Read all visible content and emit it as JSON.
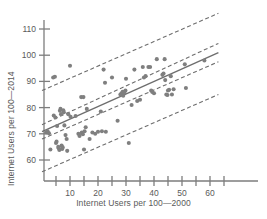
{
  "chart_data": {
    "type": "scatter",
    "title": "",
    "xlabel": "Internet Users per 100—2000",
    "ylabel": "Internet Users per 100—2014",
    "xlim": [
      0,
      66
    ],
    "ylim": [
      55,
      116
    ],
    "xticks": [
      10,
      20,
      30,
      40,
      50,
      60
    ],
    "xminorticks": [
      5,
      15,
      25,
      35,
      45,
      55,
      65
    ],
    "yticks": [
      60,
      70,
      80,
      90,
      100,
      110
    ],
    "grid": false,
    "legend": null,
    "marker_color": "#808080",
    "line_color": "#6e6e6e",
    "points": [
      [
        1.5,
        70.5
      ],
      [
        2.0,
        71.0
      ],
      [
        2.5,
        70.2
      ],
      [
        3.0,
        64.0
      ],
      [
        4.0,
        91.5
      ],
      [
        4.6,
        91.8
      ],
      [
        4.2,
        77.0
      ],
      [
        4.8,
        76.2
      ],
      [
        5.0,
        66.5
      ],
      [
        5.2,
        67.0
      ],
      [
        5.4,
        73.0
      ],
      [
        5.8,
        65.0
      ],
      [
        6.0,
        64.5
      ],
      [
        6.2,
        63.8
      ],
      [
        6.4,
        78.8
      ],
      [
        6.6,
        79.5
      ],
      [
        6.8,
        77.5
      ],
      [
        7.0,
        65.5
      ],
      [
        7.2,
        64.2
      ],
      [
        7.4,
        64.8
      ],
      [
        7.6,
        79.0
      ],
      [
        7.8,
        78.2
      ],
      [
        8.0,
        73.2
      ],
      [
        8.4,
        69.5
      ],
      [
        8.8,
        68.0
      ],
      [
        9.0,
        63.5
      ],
      [
        9.4,
        77.5
      ],
      [
        10.0,
        96.0
      ],
      [
        10.2,
        76.5
      ],
      [
        12.0,
        76.8
      ],
      [
        13.0,
        70.0
      ],
      [
        13.4,
        69.2
      ],
      [
        14.0,
        84.0
      ],
      [
        14.8,
        84.0
      ],
      [
        14.2,
        70.5
      ],
      [
        14.6,
        69.8
      ],
      [
        15.0,
        64.0
      ],
      [
        15.2,
        71.0
      ],
      [
        15.6,
        72.5
      ],
      [
        16.0,
        79.5
      ],
      [
        17.0,
        68.0
      ],
      [
        18.0,
        70.5
      ],
      [
        19.0,
        70.0
      ],
      [
        20.0,
        70.8
      ],
      [
        21.0,
        78.5
      ],
      [
        21.4,
        71.0
      ],
      [
        22.0,
        94.5
      ],
      [
        22.5,
        89.5
      ],
      [
        22.8,
        70.8
      ],
      [
        25.0,
        91.5
      ],
      [
        27.0,
        75.0
      ],
      [
        28.0,
        85.0
      ],
      [
        28.4,
        85.5
      ],
      [
        28.8,
        86.0
      ],
      [
        29.0,
        84.5
      ],
      [
        29.4,
        85.8
      ],
      [
        29.8,
        86.5
      ],
      [
        30.0,
        91.0
      ],
      [
        31.0,
        66.5
      ],
      [
        32.0,
        81.0
      ],
      [
        33.0,
        94.5
      ],
      [
        34.0,
        82.5
      ],
      [
        35.0,
        83.0
      ],
      [
        36.0,
        95.5
      ],
      [
        36.4,
        91.5
      ],
      [
        37.0,
        92.0
      ],
      [
        38.0,
        95.5
      ],
      [
        38.6,
        95.5
      ],
      [
        39.0,
        86.5
      ],
      [
        39.4,
        86.0
      ],
      [
        40.0,
        85.5
      ],
      [
        41.0,
        98.5
      ],
      [
        43.0,
        92.5
      ],
      [
        43.4,
        93.0
      ],
      [
        43.8,
        98.5
      ],
      [
        44.0,
        90.5
      ],
      [
        44.4,
        85.0
      ],
      [
        44.8,
        84.8
      ],
      [
        45.0,
        86.5
      ],
      [
        45.4,
        86.8
      ],
      [
        46.0,
        92.0
      ],
      [
        46.4,
        85.0
      ],
      [
        47.0,
        87.0
      ],
      [
        51.0,
        96.5
      ],
      [
        51.4,
        87.5
      ],
      [
        58.0,
        98.0
      ]
    ],
    "fit_line": {
      "style": "solid",
      "label": "regression line",
      "x": [
        0,
        63
      ],
      "y": [
        70.8,
        101.0
      ]
    },
    "bands": [
      {
        "style": "dashed",
        "label": "upper prediction band",
        "x": [
          0,
          63
        ],
        "y": [
          86.5,
          116.0
        ]
      },
      {
        "style": "dashed",
        "label": "upper confidence band",
        "x": [
          0,
          63
        ],
        "y": [
          73.5,
          104.5
        ]
      },
      {
        "style": "dashed",
        "label": "lower confidence band",
        "x": [
          0,
          63
        ],
        "y": [
          68.0,
          97.5
        ]
      },
      {
        "style": "dashed",
        "label": "lower prediction band",
        "x": [
          0,
          63
        ],
        "y": [
          55.5,
          85.0
        ]
      }
    ]
  }
}
